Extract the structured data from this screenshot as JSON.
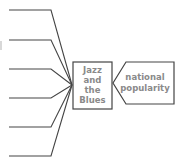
{
  "diagram": {
    "type": "fishbone-fragment",
    "colors": {
      "line": "#444444",
      "text": "#8a8a8a",
      "box_border": "#444444",
      "background": "#ffffff"
    },
    "center_box": {
      "lines": [
        "Jazz",
        "and",
        "the",
        "Blues"
      ]
    },
    "effect_node": {
      "lines": [
        "national",
        "popularity"
      ]
    },
    "branches": [
      {
        "y": 10
      },
      {
        "y": 40
      },
      {
        "y": 69
      },
      {
        "y": 98
      },
      {
        "y": 127
      },
      {
        "y": 156
      }
    ]
  }
}
